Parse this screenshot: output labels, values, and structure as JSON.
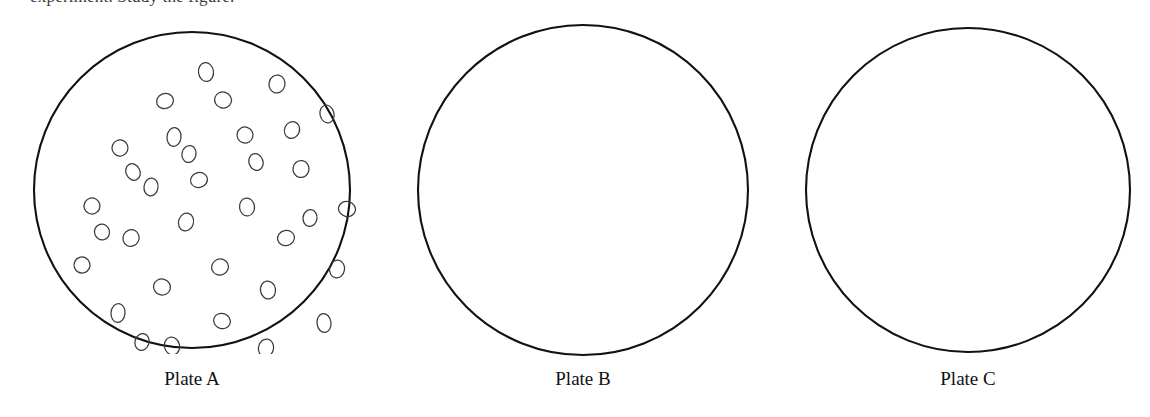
{
  "figure": {
    "background_color": "#ffffff",
    "outline_color": "#111111",
    "colony_outline_color": "#3a3a3a",
    "width": 1150,
    "height": 417,
    "clipped_heading_text": "experiment. Study the figure."
  },
  "plates": [
    {
      "id": "plate-a",
      "label": "Plate A",
      "center_x": 192,
      "center_y": 190,
      "radius": 158,
      "label_y": 368,
      "growth_state": "dense colony growth",
      "colony_count": 35,
      "colonies": [
        {
          "cx": 172,
          "cy": 40,
          "rx": 7.5,
          "ry": 9.5,
          "rot": -8
        },
        {
          "cx": 243,
          "cy": 52,
          "rx": 8.0,
          "ry": 9.0,
          "rot": 12
        },
        {
          "cx": 131,
          "cy": 69,
          "rx": 8.5,
          "ry": 7.5,
          "rot": -22
        },
        {
          "cx": 189,
          "cy": 68,
          "rx": 8.5,
          "ry": 8.0,
          "rot": 18
        },
        {
          "cx": 293,
          "cy": 82,
          "rx": 7.0,
          "ry": 9.0,
          "rot": -14
        },
        {
          "cx": 140,
          "cy": 105,
          "rx": 7.0,
          "ry": 9.5,
          "rot": 6
        },
        {
          "cx": 211,
          "cy": 103,
          "rx": 8.0,
          "ry": 8.0,
          "rot": -30
        },
        {
          "cx": 86,
          "cy": 116,
          "rx": 8.0,
          "ry": 8.0,
          "rot": 24
        },
        {
          "cx": 267,
          "cy": 137,
          "rx": 8.0,
          "ry": 8.5,
          "rot": 10
        },
        {
          "cx": 165,
          "cy": 148,
          "rx": 8.5,
          "ry": 7.5,
          "rot": -16
        },
        {
          "cx": 117,
          "cy": 155,
          "rx": 7.0,
          "ry": 9.0,
          "rot": 8
        },
        {
          "cx": 58,
          "cy": 174,
          "rx": 8.0,
          "ry": 8.0,
          "rot": -20
        },
        {
          "cx": 313,
          "cy": 177,
          "rx": 8.5,
          "ry": 7.5,
          "rot": 14
        },
        {
          "cx": 213,
          "cy": 175,
          "rx": 7.5,
          "ry": 9.0,
          "rot": -6
        },
        {
          "cx": 152,
          "cy": 190,
          "rx": 7.5,
          "ry": 9.0,
          "rot": 16
        },
        {
          "cx": 252,
          "cy": 206,
          "rx": 8.5,
          "ry": 7.5,
          "rot": -12
        },
        {
          "cx": 97,
          "cy": 206,
          "rx": 8.0,
          "ry": 8.5,
          "rot": 28
        },
        {
          "cx": 48,
          "cy": 233,
          "rx": 8.0,
          "ry": 8.0,
          "rot": -18
        },
        {
          "cx": 303,
          "cy": 237,
          "rx": 7.5,
          "ry": 9.0,
          "rot": 9
        },
        {
          "cx": 186,
          "cy": 235,
          "rx": 8.5,
          "ry": 8.0,
          "rot": -25
        },
        {
          "cx": 128,
          "cy": 255,
          "rx": 8.5,
          "ry": 8.0,
          "rot": 15
        },
        {
          "cx": 234,
          "cy": 258,
          "rx": 7.5,
          "ry": 9.0,
          "rot": -10
        },
        {
          "cx": 84,
          "cy": 281,
          "rx": 7.0,
          "ry": 9.5,
          "rot": 5
        },
        {
          "cx": 290,
          "cy": 291,
          "rx": 7.0,
          "ry": 9.5,
          "rot": -7
        },
        {
          "cx": 188,
          "cy": 289,
          "rx": 8.5,
          "ry": 7.5,
          "rot": 20
        },
        {
          "cx": 138,
          "cy": 314,
          "rx": 7.5,
          "ry": 9.0,
          "rot": -14
        },
        {
          "cx": 232,
          "cy": 316,
          "rx": 7.5,
          "ry": 9.0,
          "rot": 11
        },
        {
          "cx": 183,
          "cy": 338,
          "rx": 7.0,
          "ry": 9.5,
          "rot": -4
        },
        {
          "cx": 258,
          "cy": 98,
          "rx": 7.5,
          "ry": 8.5,
          "rot": 22
        },
        {
          "cx": 99,
          "cy": 140,
          "rx": 7.0,
          "ry": 8.5,
          "rot": -26
        },
        {
          "cx": 276,
          "cy": 186,
          "rx": 7.0,
          "ry": 8.5,
          "rot": 7
        },
        {
          "cx": 68,
          "cy": 200,
          "rx": 7.5,
          "ry": 8.0,
          "rot": -15
        },
        {
          "cx": 155,
          "cy": 122,
          "rx": 7.0,
          "ry": 8.5,
          "rot": 13
        },
        {
          "cx": 222,
          "cy": 130,
          "rx": 7.0,
          "ry": 8.5,
          "rot": -19
        },
        {
          "cx": 108,
          "cy": 310,
          "rx": 7.0,
          "ry": 8.5,
          "rot": 17
        }
      ]
    },
    {
      "id": "plate-b",
      "label": "Plate B",
      "center_x": 583,
      "center_y": 190,
      "radius": 165,
      "label_y": 368,
      "growth_state": "no growth",
      "colony_count": 0,
      "colonies": []
    },
    {
      "id": "plate-c",
      "label": "Plate C",
      "center_x": 968,
      "center_y": 190,
      "radius": 162,
      "label_y": 368,
      "growth_state": "no growth",
      "colony_count": 0,
      "colonies": []
    }
  ]
}
